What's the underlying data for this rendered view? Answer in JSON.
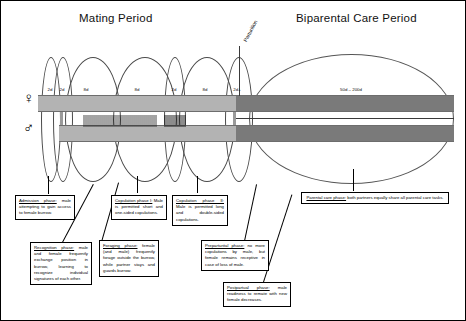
{
  "figure": {
    "periods": [
      {
        "key": "mating",
        "label": "Mating Period"
      },
      {
        "key": "biparental",
        "label": "Biparental Care Period"
      }
    ],
    "event_label": "Parturition",
    "sex_symbols": {
      "female": "♀",
      "male": "♂"
    },
    "durations": [
      {
        "label": "2d"
      },
      {
        "label": "2d"
      },
      {
        "label": "8d"
      },
      {
        "label": "8d"
      },
      {
        "label": "2d"
      },
      {
        "label": "8d"
      },
      {
        "label": "2d+"
      },
      {
        "label": "50d – 200d"
      }
    ],
    "phases": [
      {
        "key": "admission",
        "title": "Admission phase:",
        "body": " male attempting to gain access to female burrow."
      },
      {
        "key": "recognition",
        "title": "Recognition phase:",
        "body": " male and female frequently exchange position in burrow, learning to recognize individual signatures of each other."
      },
      {
        "key": "foraging",
        "title": "Foraging phase:",
        "body": " female (and male) frequently forage outside the burrow, while partner stays and guards burrow."
      },
      {
        "key": "copulation-1",
        "title": "Copulation phase I:",
        "body": " Male is permitted short and one-sided copulations."
      },
      {
        "key": "copulation-2",
        "title": "Copulation phase II:",
        "body": " Male is permitted long and double-sided copulations."
      },
      {
        "key": "preparturital",
        "title": "Preparturital phase:",
        "body": " no more copulations by male, but female remains receptive in case of loss of male."
      },
      {
        "key": "postpartual",
        "title": "Postpartual phase:",
        "body": " male readiness to remate with new female decreases."
      },
      {
        "key": "parental-care",
        "title": "Parental care phase:",
        "body": " both partners equally share all parental care tasks."
      }
    ],
    "colors": {
      "band_mating": "#b3b3b3",
      "band_biparental": "#7a7a7a",
      "outline": "#4a4a4a",
      "text": "#000000"
    }
  }
}
